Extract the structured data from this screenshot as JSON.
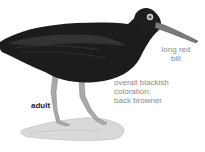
{
  "illustration": {
    "subject": "bird-adult",
    "colors": {
      "body": "#1c1c1c",
      "body_highlight": "#3a3a3a",
      "bill": "#7a7a7a",
      "legs": "#a9a9a9",
      "eye_ring": "#d8d8d8",
      "ground": "#d4d4d4",
      "label_text": "#8a8a8a",
      "age_label_text": "#1a1a1a"
    }
  },
  "annotations": {
    "bill": {
      "line1": "long red",
      "line2": "bill"
    },
    "coloration": {
      "line1": "overall blackish",
      "line2": "coloration;",
      "line3": "back browner"
    },
    "age": {
      "label": "adult"
    }
  }
}
